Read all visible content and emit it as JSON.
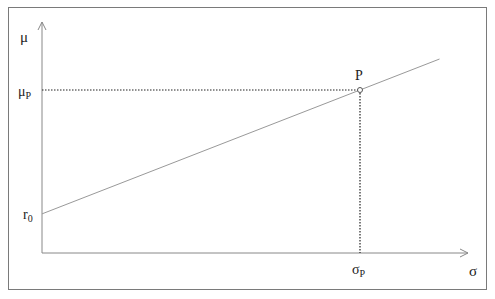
{
  "diagram": {
    "type": "line-diagram",
    "title": "",
    "y_axis_label": "μ",
    "x_axis_label": "σ",
    "intercept_label": "r",
    "intercept_subscript": "0",
    "point_label": "P",
    "point_y_label": "μ",
    "point_y_subscript": "P",
    "point_x_label": "σ",
    "point_x_subscript": "P"
  },
  "chart_data": {
    "type": "line",
    "title": "",
    "xlabel": "σ",
    "ylabel": "μ",
    "xlim": [
      0,
      1.25
    ],
    "ylim": [
      0,
      1.15
    ],
    "grid": false,
    "series": [
      {
        "name": "line through r0 and P",
        "x": [
          0,
          1.0,
          1.25
        ],
        "y": [
          0.24,
          1.0,
          1.19
        ]
      }
    ],
    "points": [
      {
        "label": "P",
        "x": 1.0,
        "y": 1.0
      }
    ],
    "intercept": {
      "label": "r0",
      "y": 0.24
    },
    "annotations": [
      "μP",
      "σP",
      "r0",
      "P"
    ]
  }
}
